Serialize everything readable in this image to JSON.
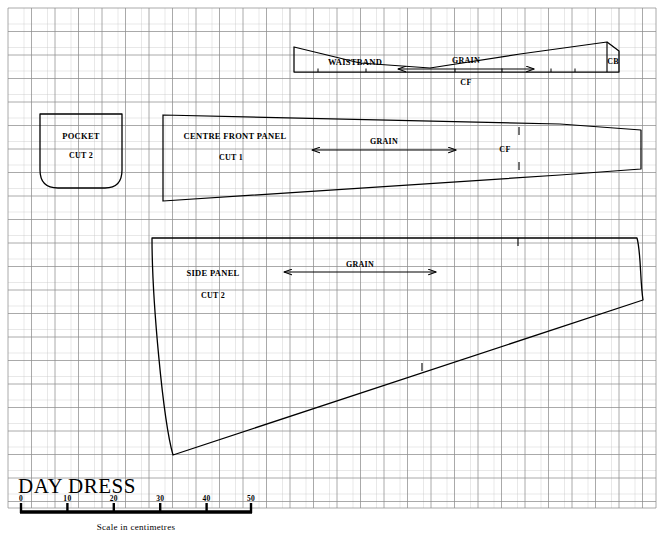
{
  "document": {
    "title": "DAY DRESS",
    "kind": "sewing-pattern-layout"
  },
  "scale": {
    "caption": "Scale in centimetres",
    "unit": "cm",
    "ticks": [
      "0",
      "10",
      "20",
      "30",
      "40",
      "50"
    ],
    "min": 0,
    "max": 50
  },
  "grid": {
    "spacing_px": 23.5,
    "minor_color": "#b9b9b9",
    "major_color": "#8c8c8c"
  },
  "colors": {
    "ink": "#000000",
    "paper": "#ffffff",
    "grid_light": "#c2c2c2",
    "grid_dark": "#7d7d7d"
  },
  "pieces": [
    {
      "id": "waistband",
      "name": "WAISTBAND",
      "cut": "",
      "grain_label": "GRAIN",
      "marks": [
        "CF",
        "CB"
      ]
    },
    {
      "id": "pocket",
      "name": "POCKET",
      "cut": "CUT 2",
      "grain_label": "",
      "marks": []
    },
    {
      "id": "centre-front-panel",
      "name": "CENTRE FRONT PANEL",
      "cut": "CUT 1",
      "grain_label": "GRAIN",
      "marks": [
        "CF"
      ]
    },
    {
      "id": "side-panel",
      "name": "SIDE PANEL",
      "cut": "CUT 2",
      "grain_label": "GRAIN",
      "marks": []
    }
  ],
  "labels": {
    "waistband_name": "WAISTBAND",
    "waistband_grain": "GRAIN",
    "waistband_cf": "CF",
    "waistband_cb": "CB",
    "pocket_name": "POCKET",
    "pocket_cut": "CUT 2",
    "cfp_name": "CENTRE FRONT PANEL",
    "cfp_cut": "CUT 1",
    "cfp_grain": "GRAIN",
    "cfp_cf": "CF",
    "side_name": "SIDE PANEL",
    "side_cut": "CUT 2",
    "side_grain": "GRAIN"
  }
}
